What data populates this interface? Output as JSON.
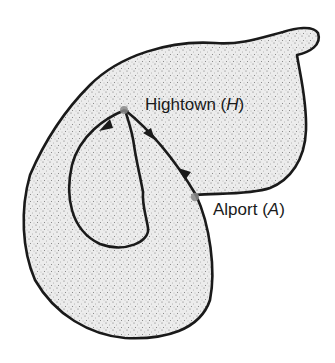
{
  "figure": {
    "type": "map-diagram",
    "colors": {
      "outline": "#1a1a1a",
      "fill": "#e9e9e9",
      "stipple": "#6b6b6b",
      "town_dot": "#8a8a8a"
    }
  },
  "places": [
    {
      "name": "Hightown",
      "abbr": "H",
      "label_prefix": "Hightown (",
      "label_suffix": ")"
    },
    {
      "name": "Alport",
      "abbr": "A",
      "label_prefix": "Alport (",
      "label_suffix": ")"
    }
  ],
  "routes": [
    {
      "id": "loop",
      "from": "H",
      "to": "H",
      "direction": "anticlockwise loop"
    },
    {
      "id": "h-a",
      "from": "H",
      "to": "A",
      "direction": "both ways"
    }
  ]
}
